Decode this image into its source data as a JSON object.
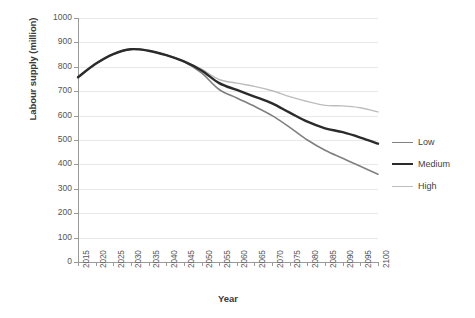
{
  "chart_data": {
    "type": "line",
    "title": "",
    "xlabel": "Year",
    "ylabel": "Labour supply (million)",
    "x": [
      2015,
      2020,
      2025,
      2030,
      2035,
      2040,
      2045,
      2050,
      2055,
      2060,
      2065,
      2070,
      2075,
      2080,
      2085,
      2090,
      2095,
      2100
    ],
    "xtick_labels": [
      "2015",
      "2020",
      "2025",
      "2030",
      "2035",
      "2040",
      "2045",
      "2050",
      "2055",
      "2060",
      "2065",
      "2070",
      "2075",
      "2080",
      "2085",
      "2090",
      "2095",
      "2100"
    ],
    "ytick_labels": [
      "1000",
      "900",
      "800",
      "700",
      "600",
      "500",
      "400",
      "300",
      "200",
      "100",
      "0"
    ],
    "yticks": [
      1000,
      900,
      800,
      700,
      600,
      500,
      400,
      300,
      200,
      100,
      0
    ],
    "ylim": [
      0,
      1000
    ],
    "xlim": [
      2015,
      2100
    ],
    "grid": "horizontal",
    "legend_position": "right",
    "series": [
      {
        "name": "Low",
        "color": "#808080",
        "width": 1.6,
        "values": [
          757,
          812,
          852,
          872,
          866,
          848,
          822,
          775,
          707,
          672,
          638,
          600,
          552,
          500,
          458,
          425,
          392,
          360
        ]
      },
      {
        "name": "Medium",
        "color": "#2b2b2b",
        "width": 2.4,
        "values": [
          757,
          812,
          852,
          872,
          866,
          848,
          822,
          785,
          733,
          705,
          678,
          650,
          612,
          575,
          548,
          532,
          510,
          485
        ]
      },
      {
        "name": "High",
        "color": "#bdbdbd",
        "width": 1.4,
        "values": [
          757,
          812,
          852,
          872,
          866,
          848,
          822,
          790,
          748,
          733,
          720,
          702,
          678,
          658,
          642,
          640,
          632,
          615
        ]
      }
    ]
  },
  "legend": {
    "items": [
      {
        "label": "Low"
      },
      {
        "label": "Medium"
      },
      {
        "label": "High"
      }
    ]
  },
  "axes": {
    "y_title": "Labour supply (million)",
    "x_title": "Year"
  }
}
